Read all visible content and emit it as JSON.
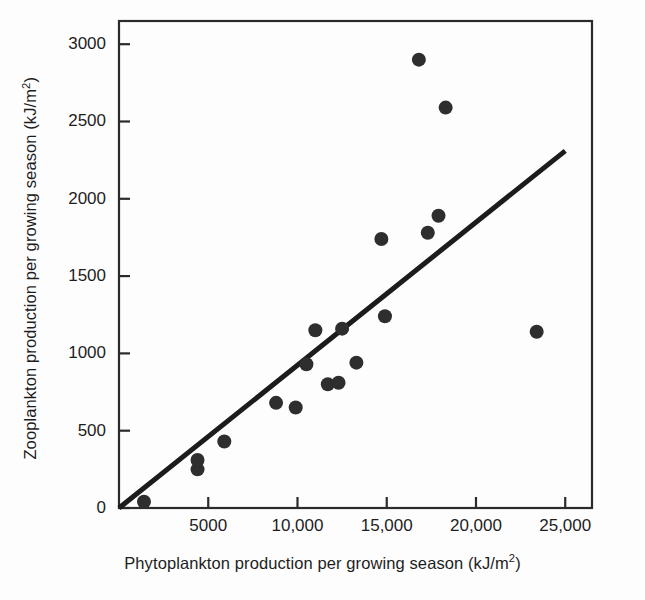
{
  "figure": {
    "title": "",
    "background_color": "#fdfdfd",
    "frame_color": "#2b2b2b",
    "marker_color": "#2e2e2e",
    "line_color": "#1c1c1c"
  },
  "axes": {
    "x": {
      "label_prefix": "Phytoplankton production per growing season (kJ/m",
      "label_suffix": ")",
      "superscript": "2",
      "ticks": [
        "5000",
        "10,000",
        "15,000",
        "20,000",
        "25,000"
      ],
      "tick_values": [
        5000,
        10000,
        15000,
        20000,
        25000
      ],
      "range": [
        0,
        26500
      ]
    },
    "y": {
      "label_prefix": "Zooplankton production per growing season (kJ/m",
      "label_suffix": ")",
      "superscript": "2",
      "ticks": [
        "3000",
        "2500",
        "2000",
        "1500",
        "1000",
        "500",
        "0"
      ],
      "tick_values": [
        3000,
        2500,
        2000,
        1500,
        1000,
        500,
        0
      ],
      "range": [
        0,
        3150
      ]
    }
  },
  "chart_data": {
    "type": "scatter",
    "title": "",
    "xlabel": "Phytoplankton production per growing season (kJ/m2)",
    "ylabel": "Zooplankton production per growing season (kJ/m2)",
    "xlim": [
      0,
      26500
    ],
    "ylim": [
      0,
      3150
    ],
    "grid": false,
    "legend": null,
    "x": [
      1400,
      4400,
      4400,
      5900,
      8800,
      9900,
      10500,
      11000,
      11700,
      12300,
      12500,
      13300,
      14700,
      14900,
      16800,
      17300,
      17600,
      17900,
      18300,
      23400
    ],
    "y": [
      40,
      250,
      310,
      430,
      680,
      650,
      930,
      1150,
      800,
      810,
      1160,
      940,
      1740,
      1240,
      2900,
      1780,
      1780,
      1890,
      2590,
      1140
    ],
    "points": [
      {
        "x": 1400,
        "y": 40
      },
      {
        "x": 4400,
        "y": 250
      },
      {
        "x": 4400,
        "y": 310
      },
      {
        "x": 5900,
        "y": 430
      },
      {
        "x": 8800,
        "y": 680
      },
      {
        "x": 9900,
        "y": 650
      },
      {
        "x": 10500,
        "y": 930
      },
      {
        "x": 11000,
        "y": 1150
      },
      {
        "x": 11700,
        "y": 800
      },
      {
        "x": 12300,
        "y": 810
      },
      {
        "x": 12500,
        "y": 1160
      },
      {
        "x": 13300,
        "y": 940
      },
      {
        "x": 14700,
        "y": 1740
      },
      {
        "x": 14900,
        "y": 1240
      },
      {
        "x": 16800,
        "y": 2900
      },
      {
        "x": 17300,
        "y": 1780
      },
      {
        "x": 17900,
        "y": 1890
      },
      {
        "x": 18300,
        "y": 2590
      },
      {
        "x": 23400,
        "y": 1140
      }
    ],
    "marker": {
      "shape": "circle",
      "size_px": 14,
      "color": "#2e2e2e"
    },
    "trendline": {
      "type": "linear",
      "x_start": 0,
      "y_start": 0,
      "x_end": 25000,
      "y_end": 2310,
      "slope": 0.0924,
      "intercept": 0,
      "color": "#1c1c1c",
      "width_px": 5
    }
  }
}
